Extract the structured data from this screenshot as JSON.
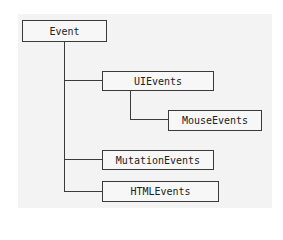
{
  "diagram": {
    "type": "hierarchy",
    "root": "Event",
    "nodes": {
      "event": "Event",
      "ui_events": "UIEvents",
      "mouse_events": "MouseEvents",
      "mutation_events": "MutationEvents",
      "html_events": "HTMLEvents"
    },
    "edges": [
      [
        "Event",
        "UIEvents"
      ],
      [
        "UIEvents",
        "MouseEvents"
      ],
      [
        "Event",
        "MutationEvents"
      ],
      [
        "Event",
        "HTMLEvents"
      ]
    ]
  }
}
